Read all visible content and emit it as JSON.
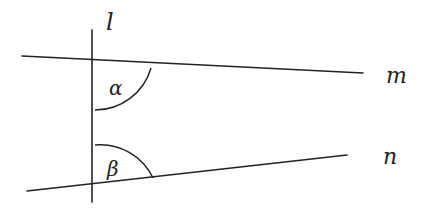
{
  "diagram": {
    "type": "geometry-transversal",
    "lines": {
      "l": {
        "label": "l",
        "x1": 92,
        "y1": 30,
        "x2": 92,
        "y2": 202
      },
      "m": {
        "label": "m",
        "x1": 22,
        "y1": 56,
        "x2": 363,
        "y2": 73
      },
      "n": {
        "label": "n",
        "x1": 27,
        "y1": 191,
        "x2": 347,
        "y2": 155
      }
    },
    "angles": {
      "alpha": {
        "label": "α"
      },
      "beta": {
        "label": "β"
      }
    },
    "colors": {
      "stroke": "#222222",
      "background": "#ffffff"
    }
  }
}
